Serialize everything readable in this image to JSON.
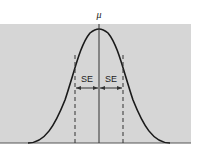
{
  "diagram": {
    "mean_label": "μ",
    "left_interval_label": "SE",
    "right_interval_label": "SE",
    "colors": {
      "background": "#d6d6d6",
      "curve": "#1a1a1a",
      "lines": "#333333",
      "page": "#ffffff"
    }
  }
}
